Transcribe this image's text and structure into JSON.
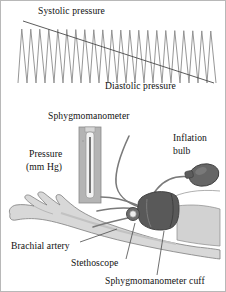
{
  "figure": {
    "background": "#ffffff",
    "border_color": "#b8b8b8"
  },
  "labels": {
    "systolic": "Systolic pressure",
    "diastolic": "Diastolic pressure",
    "sphygmomanometer": "Sphygmomanometer",
    "pressure": "Pressure",
    "units": "(mm Hg)",
    "inflation": "Inflation",
    "bulb": "bulb",
    "brachial_artery": "Brachial artery",
    "stethoscope": "Stethoscope",
    "cuff": "Sphygmomanometer cuff"
  },
  "colors": {
    "trace": "#8a8a8a",
    "trend_line": "#4a4a4a",
    "skin": "#d8d8d8",
    "skin_shadow": "#c0c0c0",
    "cuff_dark": "#595959",
    "bulb_dark": "#666666",
    "column_gray": "#b4b4b4",
    "tube_white": "#f2f2f2",
    "mercury": "#555555",
    "outline": "#6e6e6e",
    "text": "#111111"
  },
  "chart_data": {
    "type": "line",
    "xlabel": "",
    "ylabel": "",
    "grid": false,
    "legend": null,
    "annotations": [
      {
        "text": "Systolic pressure",
        "at": "upper-left trend line"
      },
      {
        "text": "Diastolic pressure",
        "at": "lower-right trend line"
      }
    ],
    "series": [
      {
        "name": "Arterial pressure oscillations",
        "cycles": 22,
        "peak_y_start": 28,
        "peak_y_end": 30,
        "trough_y": 82,
        "x_start": 17,
        "x_end": 215
      },
      {
        "name": "Cuff pressure decline (trend line)",
        "points": [
          [
            22,
            20
          ],
          [
            213,
            82
          ]
        ]
      }
    ],
    "xlim": [
      17,
      215
    ],
    "ylim": [
      28,
      82
    ]
  },
  "diagram": {
    "type": "anatomical-illustration",
    "parts": [
      {
        "name": "mercury-column",
        "label": "Sphygmomanometer"
      },
      {
        "name": "pressure-scale",
        "label": "Pressure (mm Hg)"
      },
      {
        "name": "inflation-bulb",
        "label": "Inflation bulb"
      },
      {
        "name": "arm",
        "label": "Arm with hand"
      },
      {
        "name": "cuff",
        "label": "Sphygmomanometer cuff"
      },
      {
        "name": "stethoscope-head",
        "label": "Stethoscope"
      },
      {
        "name": "brachial-artery",
        "label": "Brachial artery"
      }
    ]
  }
}
